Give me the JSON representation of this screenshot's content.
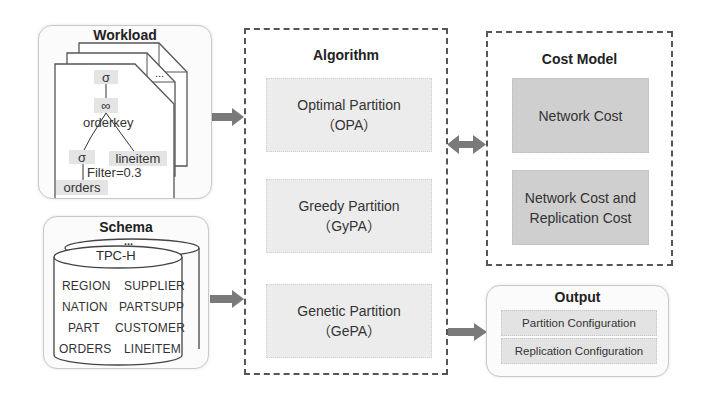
{
  "workload": {
    "title": "Workload",
    "more": "...",
    "tree": {
      "root": "σ",
      "join": "∞",
      "join_key": "orderkey",
      "left_select": "σ",
      "right_table": "lineitem",
      "filter": "Filter=0.3",
      "left_table": "orders"
    }
  },
  "schema": {
    "title": "Schema",
    "more": "...",
    "db_name": "TPC-H",
    "tables": [
      "REGION",
      "SUPPLIER",
      "NATION",
      "PARTSUPP",
      "PART",
      "CUSTOMER",
      "ORDERS",
      "LINEITEM"
    ]
  },
  "algorithm": {
    "title": "Algorithm",
    "items": [
      {
        "name": "Optimal Partition",
        "abbr": "（OPA）"
      },
      {
        "name": "Greedy Partition",
        "abbr": "（GyPA）"
      },
      {
        "name": "Genetic Partition",
        "abbr": "（GePA）"
      }
    ]
  },
  "cost_model": {
    "title": "Cost Model",
    "items": [
      {
        "line1": "Network Cost",
        "line2": ""
      },
      {
        "line1": "Network Cost and",
        "line2": "Replication Cost"
      }
    ]
  },
  "output": {
    "title": "Output",
    "items": [
      "Partition Configuration",
      "Replication Configuration"
    ]
  },
  "colors": {
    "arrow": "#7a7a7a",
    "algo_box": "#ececec",
    "cost_box": "#cfcfcf",
    "node_bg": "#e4e4e4"
  }
}
